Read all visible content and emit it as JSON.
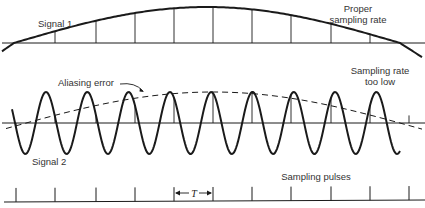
{
  "figure": {
    "top_panel": {
      "signal_label": "Signal 1",
      "rate_label_line1": "Proper",
      "rate_label_line2": "sampling rate"
    },
    "middle_panel": {
      "aliasing_label": "Aliasing error",
      "signal_label": "Signal 2",
      "rate_label_line1": "Sampling rate",
      "rate_label_line2": "too low"
    },
    "bottom_panel": {
      "pulses_label": "Sampling pulses",
      "period_label": "T"
    },
    "colors": {
      "ink": "#1a1a1a",
      "text": "#333333",
      "background": "#ffffff"
    }
  },
  "diagram_data": {
    "sampling_pulse_x": [
      16,
      55,
      96,
      135,
      174,
      213,
      252,
      291,
      331,
      370,
      409
    ],
    "sampling_period_px": 39.3,
    "signal2_period_px": 41.3,
    "signal2_peaks_x": [
      46,
      87,
      130,
      171,
      212,
      253,
      294,
      336,
      377
    ]
  }
}
